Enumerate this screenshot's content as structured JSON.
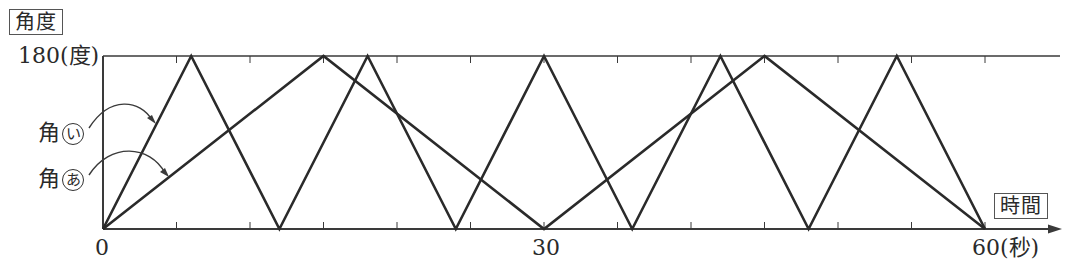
{
  "chart_data": {
    "type": "line",
    "title": "",
    "xlabel": "時間",
    "ylabel": "角度",
    "x_unit": "(秒)",
    "y_unit": "(度)",
    "xlim": [
      0,
      60
    ],
    "ylim": [
      0,
      180
    ],
    "x_tick_labels": [
      "0",
      "30",
      "60(秒)"
    ],
    "y_tick_labels": [
      "180(度)"
    ],
    "x_minor_ticks_every": 5,
    "grid": false,
    "series": [
      {
        "name": "角あ",
        "x": [
          0,
          15,
          30,
          45,
          60
        ],
        "y": [
          0,
          180,
          0,
          180,
          0
        ]
      },
      {
        "name": "角い",
        "x": [
          0,
          6,
          12,
          18,
          24,
          30,
          36,
          42,
          48,
          54,
          60
        ],
        "y": [
          0,
          180,
          0,
          180,
          0,
          180,
          0,
          180,
          0,
          180,
          0
        ]
      }
    ],
    "annotations": [
      {
        "text": "角い",
        "points_to": "series 角い near t=4s"
      },
      {
        "text": "角あ",
        "points_to": "series 角あ near t=5s"
      }
    ]
  },
  "labels": {
    "y_axis_box": "角度",
    "x_axis_box": "時間",
    "y_top": "180(度)",
    "x_zero": "0",
    "x_mid": "30",
    "x_end": "60(秒)",
    "angle_i_prefix": "角",
    "angle_i_mark": "い",
    "angle_a_prefix": "角",
    "angle_a_mark": "あ"
  },
  "colors": {
    "line": "#2a2a2a",
    "axis": "#3a3a3a"
  }
}
